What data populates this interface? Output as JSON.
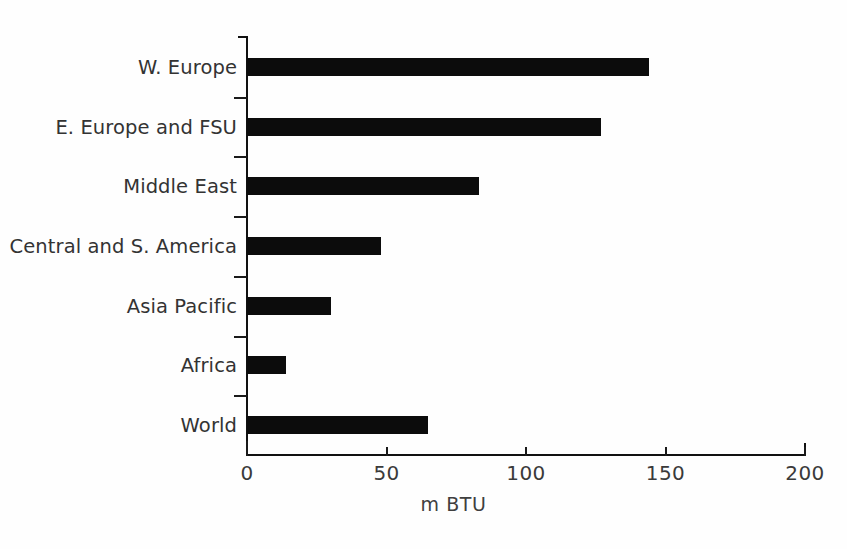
{
  "chart_data": {
    "type": "bar",
    "orientation": "horizontal",
    "title": "",
    "xlabel": "m BTU",
    "ylabel": "",
    "xlim": [
      0,
      200
    ],
    "xticks": [
      0,
      50,
      100,
      150,
      200
    ],
    "xtick_labels": [
      "0",
      "50",
      "100",
      "150",
      "200"
    ],
    "grid": false,
    "legend": false,
    "bar_color": "#0c0c0c",
    "background_color": "#fefefe",
    "axis_color": "#111111",
    "text_color": "#333333",
    "categories": [
      "W. Europe",
      "E. Europe and FSU",
      "Middle East",
      "Central and S. America",
      "Asia Pacific",
      "Africa",
      "World"
    ],
    "values": [
      144,
      127,
      83,
      48,
      30,
      14,
      65
    ],
    "units": "m BTU",
    "series": [
      {
        "name": "Energy consumption per capita",
        "values": [
          144,
          127,
          83,
          48,
          30,
          14,
          65
        ]
      }
    ]
  }
}
